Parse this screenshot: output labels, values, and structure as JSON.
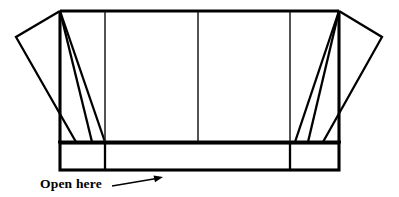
{
  "diagram": {
    "stroke_color": "#000000",
    "fill_color": "#ffffff",
    "background_color": "#ffffff",
    "annotation": {
      "label": "Open here",
      "label_x": 40,
      "label_y": 188,
      "arrow": {
        "name": "pointer-arrow",
        "from_x": 112,
        "from_y": 186,
        "to_x": 163,
        "to_y": 177
      }
    },
    "panels": [
      {
        "name": "left-end-flap",
        "kind": "slanted-flap"
      },
      {
        "name": "left-inner-flap",
        "kind": "slanted-flap"
      },
      {
        "name": "front-left-panel",
        "kind": "body-panel"
      },
      {
        "name": "front-right-panel",
        "kind": "body-panel"
      },
      {
        "name": "right-inner-flap",
        "kind": "slanted-flap"
      },
      {
        "name": "right-end-flap",
        "kind": "slanted-flap"
      },
      {
        "name": "bottom-left-tab",
        "kind": "bottom-panel"
      },
      {
        "name": "bottom-center-strip",
        "kind": "bottom-panel"
      },
      {
        "name": "bottom-right-tab",
        "kind": "bottom-panel"
      }
    ],
    "geometry": {
      "body_top_y": 11,
      "body_bottom_y": 142,
      "body_left_x": 60,
      "body_right_x": 339,
      "bottom_strip_top_y": 143,
      "bottom_strip_bottom_y": 170,
      "divider_x_1": 105,
      "divider_x_2": 198,
      "divider_x_3": 290,
      "left_outer_point_x": 16,
      "left_outer_point_y": 37,
      "right_outer_point_x": 382,
      "right_outer_point_y": 37
    }
  }
}
